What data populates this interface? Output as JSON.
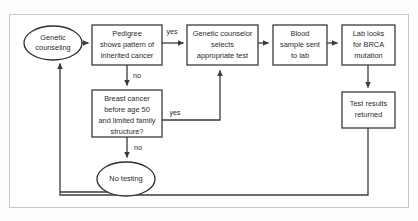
{
  "figure": {
    "background_color": "#fdfdfd",
    "frame_color": "#c9c9c9",
    "node_stroke_color": "#3b3b3b",
    "text_color": "#2b2b2b"
  },
  "nodes": {
    "genetic_counseling": {
      "shape": "ellipse",
      "lines": [
        "Genetic",
        "counseling"
      ]
    },
    "pedigree": {
      "shape": "rect",
      "lines": [
        "Pedigree",
        "shows pattern of",
        "inherited cancer"
      ]
    },
    "counselor_selects": {
      "shape": "rect",
      "lines": [
        "Genetic counselor",
        "selects",
        "appropriate test"
      ]
    },
    "blood_sample": {
      "shape": "rect",
      "lines": [
        "Blood",
        "sample sent",
        "to lab"
      ]
    },
    "lab_looks": {
      "shape": "rect",
      "lines": [
        "Lab looks",
        "for BRCA",
        "mutation"
      ]
    },
    "test_results": {
      "shape": "rect",
      "lines": [
        "Test results",
        "returned"
      ]
    },
    "breast_cancer": {
      "shape": "rect",
      "lines": [
        "Breast cancer",
        "before age 50",
        "and limited family",
        "structure?"
      ]
    },
    "no_testing": {
      "shape": "ellipse",
      "lines": [
        "No testing"
      ]
    }
  },
  "edge_labels": {
    "pedigree_yes": "yes",
    "pedigree_no": "no",
    "breast_yes": "yes",
    "breast_no": "no"
  }
}
